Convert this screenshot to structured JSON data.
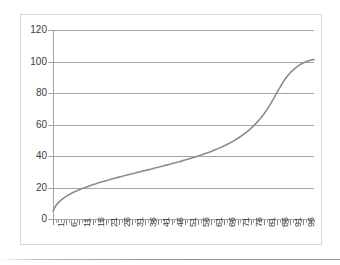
{
  "chart_data": {
    "type": "line",
    "title": "",
    "subtitle": "",
    "xlabel": "",
    "ylabel": "",
    "xlim": [
      1,
      100
    ],
    "ylim": [
      0,
      120
    ],
    "grid": true,
    "legend": false,
    "legend_position": "none",
    "y_ticks": [
      0,
      20,
      40,
      60,
      80,
      100,
      120
    ],
    "y_tick_labels": [
      "0",
      "20",
      "40",
      "60",
      "80",
      "100",
      "120"
    ],
    "x_tick_labels": [
      "1",
      "6",
      "11",
      "16",
      "21",
      "26",
      "31",
      "36",
      "41",
      "46",
      "51",
      "56",
      "61",
      "66",
      "71",
      "76",
      "81",
      "86",
      "91",
      "96"
    ],
    "x_minor_tick_count": 100,
    "series": [
      {
        "name": "series-1",
        "color": "#8c8c8c",
        "line_width": 1.6,
        "markers": false,
        "x": [
          1,
          2,
          3,
          4,
          5,
          6,
          7,
          8,
          9,
          10,
          11,
          12,
          13,
          14,
          15,
          16,
          17,
          18,
          19,
          20,
          21,
          22,
          23,
          24,
          25,
          26,
          27,
          28,
          29,
          30,
          31,
          32,
          33,
          34,
          35,
          36,
          37,
          38,
          39,
          40,
          41,
          42,
          43,
          44,
          45,
          46,
          47,
          48,
          49,
          50,
          51,
          52,
          53,
          54,
          55,
          56,
          57,
          58,
          59,
          60,
          61,
          62,
          63,
          64,
          65,
          66,
          67,
          68,
          69,
          70,
          71,
          72,
          73,
          74,
          75,
          76,
          77,
          78,
          79,
          80,
          81,
          82,
          83,
          84,
          85,
          86,
          87,
          88,
          89,
          90,
          91,
          92,
          93,
          94,
          95,
          96,
          97,
          98,
          99,
          100
        ],
        "values": [
          5.0,
          8.3,
          10.4,
          12.0,
          13.3,
          14.4,
          15.4,
          16.3,
          17.1,
          17.9,
          18.6,
          19.3,
          19.9,
          20.5,
          21.1,
          21.7,
          22.2,
          22.8,
          23.3,
          23.8,
          24.3,
          24.7,
          25.2,
          25.7,
          26.1,
          26.6,
          27.0,
          27.4,
          27.9,
          28.3,
          28.7,
          29.1,
          29.6,
          30.0,
          30.4,
          30.8,
          31.2,
          31.6,
          32.1,
          32.5,
          32.9,
          33.3,
          33.8,
          34.2,
          34.6,
          35.1,
          35.5,
          36.0,
          36.4,
          36.9,
          37.4,
          37.9,
          38.4,
          38.9,
          39.4,
          40.0,
          40.5,
          41.1,
          41.7,
          42.3,
          42.9,
          43.6,
          44.3,
          45.0,
          45.7,
          46.5,
          47.3,
          48.2,
          49.1,
          50.1,
          51.1,
          52.2,
          53.4,
          54.6,
          56.0,
          57.4,
          59.0,
          60.7,
          62.5,
          64.5,
          66.7,
          69.1,
          71.7,
          74.5,
          77.4,
          80.4,
          83.3,
          86.2,
          88.7,
          91.0,
          92.9,
          94.5,
          96.0,
          97.2,
          98.3,
          99.2,
          99.9,
          100.5,
          100.9,
          101.2
        ]
      }
    ]
  },
  "axes": {
    "y_axis_name": "value-axis",
    "x_axis_name": "category-axis"
  },
  "colors": {
    "series": "#8c8c8c",
    "gridline": "#a6a6a6",
    "axis": "#a6a6a6",
    "tick_label": "#404040",
    "frame_border": "#d8d8d8",
    "background": "#ffffff"
  }
}
